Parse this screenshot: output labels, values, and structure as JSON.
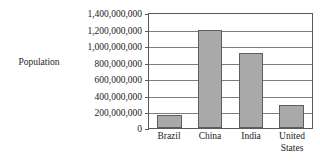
{
  "chart_data": {
    "type": "bar",
    "title": "",
    "xlabel": "",
    "ylabel": "Population",
    "categories": [
      "Brazil",
      "China",
      "India",
      "United States"
    ],
    "category_lines": [
      [
        "Brazil"
      ],
      [
        "China"
      ],
      [
        "India"
      ],
      [
        "United",
        "States"
      ]
    ],
    "values": [
      165000000,
      1200000000,
      925000000,
      280000000
    ],
    "ylim": [
      0,
      1400000000
    ],
    "ytick_values": [
      0,
      200000000,
      400000000,
      600000000,
      800000000,
      1000000000,
      1200000000,
      1400000000
    ],
    "ytick_labels": [
      "0",
      "200,000,000",
      "400,000,000",
      "600,000,000",
      "800,000,000",
      "1,000,000,000",
      "1,200,000,000",
      "1,400,000,000"
    ],
    "grid": true,
    "legend": false,
    "legend_position": "none",
    "bar_color": "#a9a9a9",
    "bar_edge_color": "#5e5e5e",
    "axis_color": "#5a5a5a",
    "grid_color": "#7d7d7d",
    "background_color": "#ffffff"
  },
  "labels": {
    "y_axis_title": "Population",
    "ytick_0": "0",
    "ytick_1": "200,000,000",
    "ytick_2": "400,000,000",
    "ytick_3": "600,000,000",
    "ytick_4": "800,000,000",
    "ytick_5": "1,000,000,000",
    "ytick_6": "1,200,000,000",
    "ytick_7": "1,400,000,000",
    "cat_0_line1": "Brazil",
    "cat_1_line1": "China",
    "cat_2_line1": "India",
    "cat_3_line1": "United",
    "cat_3_line2": "States"
  }
}
